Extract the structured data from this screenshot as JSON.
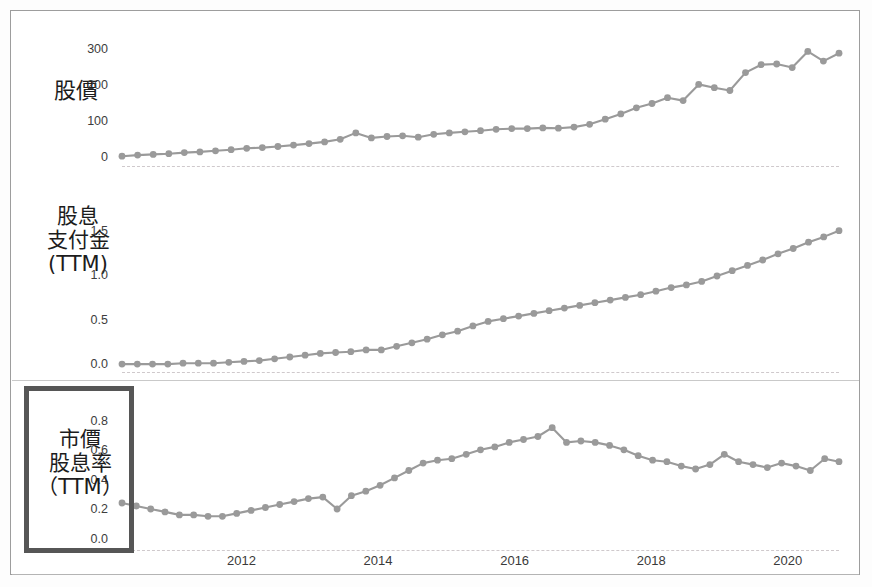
{
  "figure": {
    "width": 872,
    "height": 587,
    "background": "#ffffff",
    "frame_color": "#9d9d9d",
    "series_color": "#9a9a9a",
    "highlight_box_color": "#565656"
  },
  "panels": {
    "price": {
      "label": "股價"
    },
    "dividend": {
      "label": "股息\n支付金\n(TTM)"
    },
    "yield": {
      "label": "市價\n股息率\n（TTM）",
      "highlighted": true
    }
  },
  "xticks": [
    "2012",
    "2014",
    "2016",
    "2018",
    "2020"
  ],
  "chart_data": [
    {
      "type": "line",
      "title": "股價",
      "xlabel": "",
      "ylabel": "股價",
      "ylim": [
        0,
        340
      ],
      "yticks": [
        0,
        100,
        200,
        300
      ],
      "ytick_labels": [
        "0",
        "100",
        "200",
        "300"
      ],
      "xlim": [
        2010.25,
        2020.75
      ],
      "x": [
        2010.25,
        2010.5,
        2010.75,
        2011.0,
        2011.25,
        2011.5,
        2011.75,
        2012.0,
        2012.25,
        2012.5,
        2012.75,
        2013.0,
        2013.25,
        2013.5,
        2013.75,
        2014.0,
        2014.25,
        2014.5,
        2014.75,
        2015.0,
        2015.25,
        2015.5,
        2015.75,
        2016.0,
        2016.25,
        2016.5,
        2016.75,
        2017.0,
        2017.25,
        2017.5,
        2017.75,
        2018.0,
        2018.25,
        2018.5,
        2018.75,
        2019.0,
        2019.25,
        2019.5,
        2019.75,
        2020.0,
        2020.25,
        2020.5
      ],
      "values": [
        5,
        8,
        10,
        12,
        15,
        17,
        20,
        23,
        27,
        29,
        32,
        36,
        40,
        45,
        52,
        70,
        56,
        60,
        62,
        58,
        66,
        70,
        73,
        76,
        80,
        82,
        82,
        84,
        83,
        86,
        94,
        108,
        123,
        140,
        152,
        168,
        160,
        205,
        196,
        188,
        238,
        260,
        262,
        252,
        297,
        270,
        292
      ],
      "grid": false,
      "legend": "none",
      "marker": "circle"
    },
    {
      "type": "line",
      "title": "股息支付金 (TTM)",
      "xlabel": "",
      "ylabel": "股息支付金 (TTM)",
      "ylim": [
        0,
        1.72
      ],
      "yticks": [
        0.0,
        0.5,
        1.0,
        1.5
      ],
      "ytick_labels": [
        "0.0",
        "0.5",
        "1.0",
        "1.5"
      ],
      "xlim": [
        2010.25,
        2020.75
      ],
      "values": [
        0.01,
        0.01,
        0.01,
        0.01,
        0.02,
        0.02,
        0.02,
        0.03,
        0.04,
        0.05,
        0.07,
        0.09,
        0.11,
        0.13,
        0.14,
        0.15,
        0.17,
        0.17,
        0.21,
        0.25,
        0.29,
        0.34,
        0.38,
        0.44,
        0.49,
        0.52,
        0.55,
        0.58,
        0.61,
        0.64,
        0.67,
        0.7,
        0.73,
        0.76,
        0.79,
        0.83,
        0.87,
        0.9,
        0.94,
        1.0,
        1.06,
        1.12,
        1.18,
        1.25,
        1.31,
        1.38,
        1.44,
        1.51
      ],
      "grid": false,
      "legend": "none",
      "marker": "circle"
    },
    {
      "type": "line",
      "title": "市價股息率 (TTM)",
      "xlabel": "",
      "ylabel": "市價股息率 (TTM)",
      "ylim": [
        0.0,
        0.92
      ],
      "yticks": [
        0.0,
        0.2,
        0.4,
        0.6,
        0.8
      ],
      "ytick_labels": [
        "0.0",
        "0.2",
        "0.4",
        "0.6",
        "0.8"
      ],
      "xlim": [
        2010.25,
        2020.75
      ],
      "values": [
        0.25,
        0.23,
        0.21,
        0.19,
        0.17,
        0.17,
        0.16,
        0.16,
        0.18,
        0.2,
        0.22,
        0.24,
        0.26,
        0.28,
        0.29,
        0.21,
        0.3,
        0.33,
        0.37,
        0.42,
        0.47,
        0.52,
        0.54,
        0.55,
        0.58,
        0.61,
        0.63,
        0.66,
        0.68,
        0.7,
        0.76,
        0.66,
        0.67,
        0.66,
        0.64,
        0.61,
        0.57,
        0.54,
        0.53,
        0.5,
        0.48,
        0.51,
        0.58,
        0.53,
        0.51,
        0.49,
        0.52,
        0.5,
        0.47,
        0.55,
        0.53
      ],
      "grid": false,
      "legend": "none",
      "marker": "circle"
    }
  ]
}
